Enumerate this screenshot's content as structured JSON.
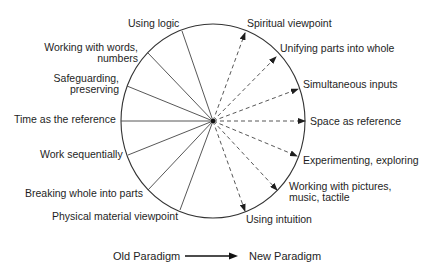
{
  "diagram": {
    "center": {
      "x": 213,
      "y": 121
    },
    "radius_x": 92,
    "radius_y": 97,
    "line_color": "#333333",
    "old_paradigm": {
      "style": "solid",
      "items": [
        {
          "label": "Using logic",
          "end": [
            182,
            31
          ]
        },
        {
          "label": "Working with words, numbers",
          "line1": "Working with words,",
          "line2": "numbers",
          "end": [
            148,
            53
          ]
        },
        {
          "label": "Safeguarding, preserving",
          "line1": "Safeguarding,",
          "line2": "preserving",
          "end": [
            127,
            86
          ]
        },
        {
          "label": "Time as the reference",
          "end": [
            121,
            121
          ]
        },
        {
          "label": "Work sequentially",
          "end": [
            128,
            155
          ]
        },
        {
          "label": "Breaking whole into parts",
          "end": [
            148,
            190
          ]
        },
        {
          "label": "Physical material viewpoint",
          "end": [
            180,
            210
          ]
        }
      ]
    },
    "new_paradigm": {
      "style": "dashed-arrow",
      "items": [
        {
          "label": "Spiritual viewpoint",
          "end": [
            245,
            33
          ]
        },
        {
          "label": "Unifying parts into whole",
          "end": [
            276,
            57
          ]
        },
        {
          "label": "Simultaneous inputs",
          "end": [
            298,
            89
          ]
        },
        {
          "label": "Space as reference",
          "end": [
            305,
            121
          ]
        },
        {
          "label": "Experimenting, exploring",
          "end": [
            297,
            156
          ]
        },
        {
          "label": "Working with pictures, music, tactile",
          "line1": "Working with pictures,",
          "line2": "music, tactile",
          "end": [
            277,
            190
          ]
        },
        {
          "label": "Using intuition",
          "end": [
            245,
            211
          ]
        }
      ]
    }
  },
  "legend": {
    "from_label": "Old Paradigm",
    "to_label": "New Paradigm"
  }
}
